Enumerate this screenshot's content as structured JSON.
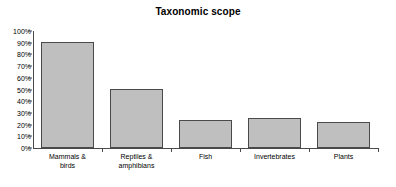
{
  "chart_data": {
    "type": "bar",
    "title": "Taxonomic scope",
    "xlabel": "",
    "ylabel": "",
    "categories": [
      "Mammals & birds",
      "Reptiles & amphibians",
      "Fish",
      "Invertebrates",
      "Plants"
    ],
    "category_lines": [
      [
        "Mammals &",
        "birds"
      ],
      [
        "Reptiles &",
        "amphibians"
      ],
      [
        "Fish"
      ],
      [
        "Invertebrates"
      ],
      [
        "Plants"
      ]
    ],
    "values": [
      91,
      50,
      24,
      25.5,
      22.5
    ],
    "ylim": [
      0,
      100
    ],
    "ytick_values": [
      0,
      10,
      20,
      30,
      40,
      50,
      60,
      70,
      80,
      90,
      100
    ],
    "ytick_labels": [
      "0%",
      "10%",
      "20%",
      "30%",
      "40%",
      "50%",
      "60%",
      "70%",
      "80%",
      "90%",
      "100%"
    ],
    "grid": false,
    "legend": false,
    "bar_color": "#bfbfbf",
    "bar_border_color": "#4a4a4a",
    "axis_color": "#4a4a4a"
  }
}
